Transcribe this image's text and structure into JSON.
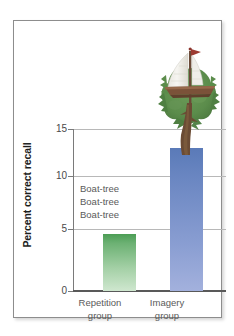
{
  "chart_data": {
    "type": "bar",
    "title": "",
    "xlabel": "",
    "ylabel": "Percent correct recall",
    "categories": [
      "Repetition group",
      "Imagery group"
    ],
    "category_lines": [
      [
        "Repetition",
        "group"
      ],
      [
        "Imagery",
        "group"
      ]
    ],
    "values": [
      5.3,
      13.2
    ],
    "series": [
      {
        "name": "Percent correct recall",
        "values": [
          5.3,
          13.2
        ]
      }
    ],
    "ylim": [
      0,
      15
    ],
    "yticks": [
      0,
      5,
      10,
      15
    ],
    "ytick_labels": [
      "0",
      "5",
      "10",
      "15"
    ],
    "grid": true,
    "legend": false,
    "legend_position": "none",
    "annotations": [
      {
        "name": "repetition-rehearsal-text",
        "lines": [
          "Boat-tree",
          "Boat-tree",
          "Boat-tree"
        ],
        "text": "Boat-tree\nBoat-tree\nBoat-tree"
      },
      {
        "name": "imagery-sailboat-tree-illustration",
        "text": ""
      }
    ],
    "bar_colors": [
      "#4c9d55",
      "#5a7ab8"
    ]
  },
  "axis": {
    "y_title": "Percent correct recall",
    "ticks": {
      "t15": "15",
      "t10": "10",
      "t5": "5",
      "t0": "0"
    }
  },
  "annotation": {
    "line1": "Boat-tree",
    "line2": "Boat-tree",
    "line3": "Boat-tree"
  },
  "categories": [
    {
      "line1": "Repetition",
      "line2": "group"
    },
    {
      "line1": "Imagery",
      "line2": "group"
    }
  ],
  "illustration": {
    "name": "sailboat-tree-illustration",
    "sail_color": "#f2f1ec",
    "mast_color": "#6b4b38",
    "flag_color": "#9c3b32",
    "hull_color": "#7b5239",
    "foliage_color": "#5c8c4c",
    "trunk_color": "#6b4b34"
  },
  "colors": {
    "frame_border": "#8d8d8d",
    "gridline": "#b8b8b8",
    "axis": "#595959",
    "tick_text": "#4a4a4a",
    "label_text": "#5a5a5a",
    "title_text": "#1d1d1d",
    "background": "#ffffff",
    "bar_green_top": "#4c9d55",
    "bar_green_bottom": "#cfe7cf",
    "bar_blue_top": "#5a7ab8",
    "bar_blue_bottom": "#a3b1dd"
  }
}
